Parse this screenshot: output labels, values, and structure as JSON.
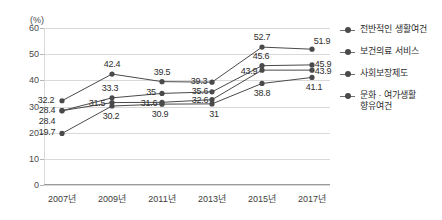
{
  "clipped_title_text": "",
  "axis": {
    "unit_label": "(%)",
    "y_ticks": [
      "0",
      "10",
      "20",
      "30",
      "40",
      "50",
      "60"
    ],
    "x_ticks": [
      "2007년",
      "2009년",
      "2011년",
      "2013년",
      "2015년",
      "2017년"
    ]
  },
  "legend": {
    "items": [
      {
        "label": "전반적인 생활여건",
        "color": "#4a4a4a",
        "marker": "line-dot-marker"
      },
      {
        "label": "보건의료 서비스",
        "color": "#4a4a4a",
        "marker": "line-dot-marker"
      },
      {
        "label": "사회보장제도",
        "color": "#4a4a4a",
        "marker": "line-dot-marker"
      },
      {
        "label": "문화 · 여가생활 향유여건",
        "color": "#4a4a4a",
        "marker": "line-dot-marker"
      }
    ]
  },
  "chart_data": {
    "type": "line",
    "title": "",
    "xlabel": "",
    "ylabel": "(%)",
    "ylim": [
      0,
      60
    ],
    "ytick_step": 10,
    "grid": true,
    "legend_position": "right",
    "categories": [
      "2007년",
      "2009년",
      "2011년",
      "2013년",
      "2015년",
      "2017년"
    ],
    "series": [
      {
        "name": "전반적인 생활여건",
        "color": "#4a4a4a",
        "values": [
          32.2,
          42.4,
          39.5,
          39.3,
          52.7,
          51.9
        ],
        "labels": [
          "32.2",
          "42.4",
          "39.5",
          "39.3",
          "52.7",
          "51.9"
        ]
      },
      {
        "name": "보건의료 서비스",
        "color": "#4a4a4a",
        "values": [
          28.4,
          33.3,
          35,
          35.6,
          45.6,
          45.9
        ],
        "labels": [
          "28.4",
          "33.3",
          "35",
          "35.6",
          "45.6",
          "45.9"
        ]
      },
      {
        "name": "사회보장제도",
        "color": "#4a4a4a",
        "values": [
          28.4,
          31.5,
          31.6,
          32.6,
          43.9,
          43.9
        ],
        "labels": [
          "28.4",
          "31.5",
          "31.6",
          "32.6",
          "43.9",
          "43.9"
        ]
      },
      {
        "name": "문화 · 여가생활 향유여건",
        "color": "#4a4a4a",
        "values": [
          19.7,
          30.2,
          30.9,
          31,
          38.8,
          41.1
        ],
        "labels": [
          "19.7",
          "30.2",
          "30.9",
          "31",
          "38.8",
          "41.1"
        ]
      }
    ]
  }
}
